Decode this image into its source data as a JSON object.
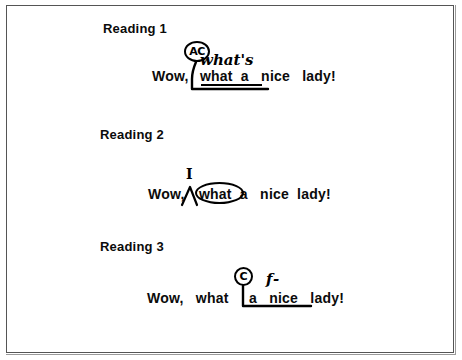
{
  "figure": {
    "background_color": "#ffffff",
    "ink_color": "#000000",
    "border_color": "#555555"
  },
  "readings": [
    {
      "heading": "Reading 1",
      "sentence_prefix": "Wow,",
      "sentence_body": "what  a   nice   lady!",
      "sentence_full": "Wow,  what  a   nice   lady!",
      "annotation_code": "AC",
      "annotation_text": "what's",
      "underlined_span": "what  a",
      "mark_type": "circled-code-with-bracket"
    },
    {
      "heading": "Reading 2",
      "sentence_prefix": "Wow,",
      "sentence_body": "what  a   nice  lady!",
      "sentence_full": "Wow,  what  a   nice  lady!",
      "annotation_code": "I",
      "annotation_text": "I",
      "circled_word": "what",
      "mark_type": "caret-with-circled-word"
    },
    {
      "heading": "Reading 3",
      "sentence_prefix": "Wow,   what",
      "sentence_body": "a   nice   lady!",
      "sentence_full": "Wow,   what  a   nice   lady!",
      "annotation_code": "C",
      "annotation_text": "f-",
      "bracketed_span": "a   nice",
      "mark_type": "circled-code-with-bracket"
    }
  ]
}
